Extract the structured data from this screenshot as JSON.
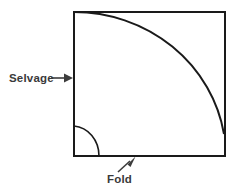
{
  "diagram": {
    "type": "sewing-fabric-fold-diagram",
    "background_color": "#ffffff",
    "line_color": "#1a1a1a",
    "label_color": "#3a3a3a",
    "labels": {
      "selvage": "Selvage",
      "fold": "Fold"
    },
    "shapes": {
      "square": {
        "name": "fabric-square",
        "x": 73,
        "y": 11,
        "width": 152,
        "height": 145
      },
      "large_arc": {
        "name": "large-quarter-circle-arc",
        "start_x": 73,
        "start_y": 11,
        "end_x": 225,
        "end_y": 133,
        "center_x": 73,
        "center_y": 156
      },
      "small_arc": {
        "name": "small-quarter-circle-arc",
        "start_x": 73,
        "start_y": 125,
        "end_x": 98,
        "end_y": 156,
        "center_x": 73,
        "center_y": 156,
        "radius": 28
      }
    },
    "callouts": {
      "selvage": {
        "name": "selvage-callout-arrow",
        "direction": "right",
        "from_x": 50,
        "from_y": 78,
        "to_x": 72,
        "to_y": 78,
        "text_x": 9,
        "text_y": 82
      },
      "fold": {
        "name": "fold-callout-arrow",
        "direction": "up-right",
        "from_x": 118,
        "from_y": 172,
        "to_x": 135,
        "to_y": 157,
        "text_x": 107,
        "text_y": 183
      }
    }
  }
}
